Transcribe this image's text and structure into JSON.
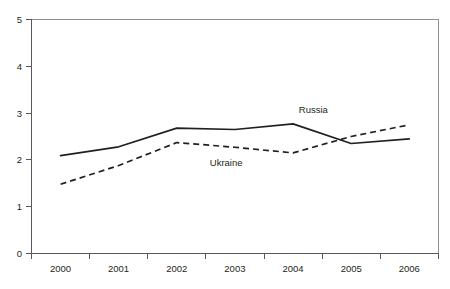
{
  "chart_data": {
    "type": "line",
    "title": "",
    "subtitle": "",
    "xlabel": "",
    "ylabel": "",
    "categories": [
      "2000",
      "2001",
      "2002",
      "2003",
      "2004",
      "2005",
      "2006"
    ],
    "x": [
      2000,
      2001,
      2002,
      2003,
      2004,
      2005,
      2006
    ],
    "ylim": [
      0,
      5
    ],
    "y_ticks": [
      "0",
      "1",
      "2",
      "3",
      "4",
      "5"
    ],
    "y_tick_values": [
      0,
      1,
      2,
      3,
      4,
      5
    ],
    "grid": false,
    "legend_position": "inline-annotation",
    "series": [
      {
        "name": "Russia",
        "style": "solid",
        "color": "#231f20",
        "values": [
          2.09,
          2.28,
          2.68,
          2.65,
          2.77,
          2.35,
          2.45
        ]
      },
      {
        "name": "Ukraine",
        "style": "dashed",
        "color": "#231f20",
        "values": [
          1.48,
          1.88,
          2.37,
          2.27,
          2.15,
          2.5,
          2.75
        ]
      }
    ],
    "annotations": [
      {
        "text": "Russia",
        "x": 2004.35,
        "y": 3.07
      },
      {
        "text": "Ukraine",
        "x": 2002.85,
        "y": 1.94
      }
    ]
  }
}
